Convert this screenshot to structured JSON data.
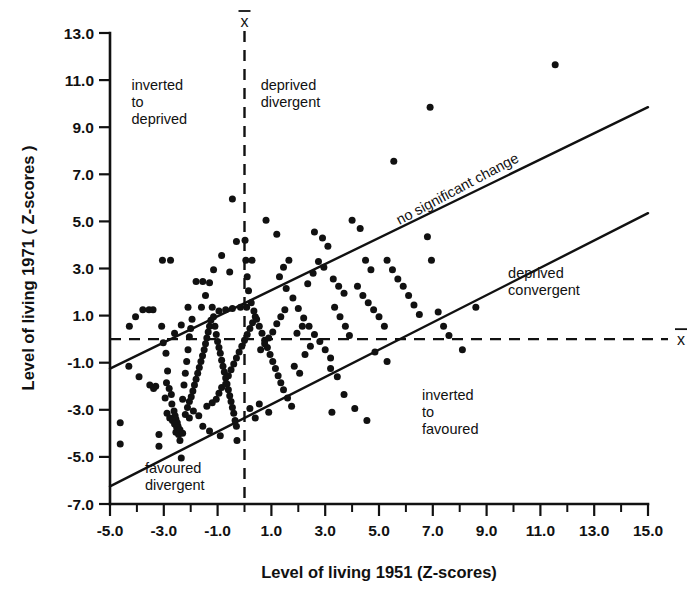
{
  "chart_data": {
    "type": "scatter",
    "title": "",
    "xlabel": "Level of living 1951 (Z-scores)",
    "ylabel": "Level of living 1971 ( Z-scores )",
    "xlim": [
      -5.0,
      15.0
    ],
    "ylim": [
      -7.0,
      13.0
    ],
    "grid": false,
    "legend": "none",
    "xticks": [
      -5.0,
      -3.0,
      -1.0,
      1.0,
      3.0,
      5.0,
      7.0,
      9.0,
      11.0,
      13.0,
      15.0
    ],
    "xticklabels": [
      "-5.0",
      "-3.0",
      "-1.0",
      "1.0",
      "3.0",
      "5.0",
      "7.0",
      "9.0",
      "11.0",
      "13.0",
      "15.0"
    ],
    "xminorticks": [
      -4.0,
      -2.0,
      0.0,
      2.0,
      4.0,
      6.0,
      8.0,
      10.0,
      12.0,
      14.0
    ],
    "yticks": [
      -7.0,
      -5.0,
      -3.0,
      -1.0,
      1.0,
      3.0,
      5.0,
      7.0,
      9.0,
      11.0,
      13.0
    ],
    "yticklabels": [
      "-7.0",
      "-5.0",
      "-3.0",
      "-1.0",
      "1.0",
      "3.0",
      "5.0",
      "7.0",
      "9.0",
      "11.0",
      "13.0"
    ],
    "reference_lines": [
      {
        "name": "mean-x-vertical",
        "orientation": "vertical",
        "value": 0.0,
        "style": "dashed",
        "label": "x̄"
      },
      {
        "name": "mean-y-horizontal",
        "orientation": "horizontal",
        "value": 0.0,
        "style": "dashed",
        "label": "x̄"
      }
    ],
    "band_lines": [
      {
        "name": "upper-band",
        "style": "solid",
        "x0": -5.0,
        "y0": -1.25,
        "x1": 15.0,
        "y1": 9.85
      },
      {
        "name": "lower-band",
        "style": "solid",
        "x0": -5.0,
        "y0": -6.25,
        "x1": 15.0,
        "y1": 5.35
      }
    ],
    "annotations": [
      {
        "name": "inverted-to-deprived",
        "text": "inverted\nto\ndeprived",
        "x": -4.2,
        "y": 10.6
      },
      {
        "name": "deprived-divergent",
        "text": "deprived\ndivergent",
        "x": 0.6,
        "y": 10.6
      },
      {
        "name": "no-significant-change",
        "text": "no significant change",
        "x": 8.0,
        "y": 6.2,
        "rotation": -28
      },
      {
        "name": "deprived-convergent",
        "text": "deprived\nconvergent",
        "x": 9.8,
        "y": 2.6
      },
      {
        "name": "inverted-to-favoured",
        "text": "inverted\nto\nfavoured",
        "x": 6.6,
        "y": -2.6
      },
      {
        "name": "favoured-divergent",
        "text": "favoured\ndivergent",
        "x": -3.7,
        "y": -5.7
      }
    ],
    "n_points": 232,
    "points": [
      [
        -4.62,
        -3.55
      ],
      [
        -4.62,
        -4.45
      ],
      [
        -4.3,
        -1.15
      ],
      [
        -4.28,
        0.55
      ],
      [
        -4.05,
        0.95
      ],
      [
        -3.92,
        -1.6
      ],
      [
        -3.78,
        1.25
      ],
      [
        -3.55,
        1.25
      ],
      [
        -3.4,
        1.25
      ],
      [
        -3.52,
        -1.95
      ],
      [
        -3.3,
        -2.0
      ],
      [
        -3.38,
        -2.1
      ],
      [
        -3.18,
        -4.05
      ],
      [
        -3.18,
        -4.55
      ],
      [
        -3.05,
        3.35
      ],
      [
        -2.75,
        3.35
      ],
      [
        -3.08,
        0.55
      ],
      [
        -3.02,
        -0.15
      ],
      [
        -2.92,
        -0.6
      ],
      [
        -2.86,
        -1.35
      ],
      [
        -2.9,
        -1.85
      ],
      [
        -2.8,
        -2.1
      ],
      [
        -2.72,
        -2.35
      ],
      [
        -2.7,
        -2.75
      ],
      [
        -2.62,
        -3.05
      ],
      [
        -2.58,
        -3.25
      ],
      [
        -2.55,
        -3.4
      ],
      [
        -2.5,
        -3.55
      ],
      [
        -2.47,
        -3.7
      ],
      [
        -2.55,
        -3.95
      ],
      [
        -2.45,
        -4.05
      ],
      [
        -2.4,
        -4.3
      ],
      [
        -2.35,
        -5.05
      ],
      [
        -2.3,
        -2.55
      ],
      [
        -2.25,
        -1.95
      ],
      [
        -2.2,
        -1.45
      ],
      [
        -2.15,
        -0.95
      ],
      [
        -2.1,
        -0.45
      ],
      [
        -2.05,
        0.1
      ],
      [
        -2.0,
        0.45
      ],
      [
        -1.95,
        0.85
      ],
      [
        -2.1,
        1.35
      ],
      [
        -2.35,
        0.6
      ],
      [
        -2.6,
        0.25
      ],
      [
        -2.95,
        -2.5
      ],
      [
        -2.88,
        -3.15
      ],
      [
        -2.78,
        -3.35
      ],
      [
        -2.68,
        -3.45
      ],
      [
        -2.6,
        -3.6
      ],
      [
        -2.52,
        -3.75
      ],
      [
        -2.4,
        -3.85
      ],
      [
        -2.3,
        -4.0
      ],
      [
        -2.2,
        -3.2
      ],
      [
        -2.12,
        -2.9
      ],
      [
        -2.05,
        -2.65
      ],
      [
        -1.98,
        -2.45
      ],
      [
        -1.92,
        -2.2
      ],
      [
        -1.86,
        -1.95
      ],
      [
        -1.8,
        -1.7
      ],
      [
        -1.74,
        -1.45
      ],
      [
        -1.68,
        -1.2
      ],
      [
        -1.62,
        -0.95
      ],
      [
        -1.56,
        -0.7
      ],
      [
        -1.5,
        -0.45
      ],
      [
        -1.45,
        -0.2
      ],
      [
        -1.4,
        0.05
      ],
      [
        -1.35,
        0.3
      ],
      [
        -1.3,
        0.55
      ],
      [
        -1.25,
        0.8
      ],
      [
        -1.6,
        1.35
      ],
      [
        -1.8,
        2.45
      ],
      [
        -1.55,
        2.45
      ],
      [
        -1.3,
        2.4
      ],
      [
        -1.45,
        1.85
      ],
      [
        -1.2,
        1.35
      ],
      [
        -1.15,
        0.95
      ],
      [
        -1.1,
        0.55
      ],
      [
        -1.05,
        0.2
      ],
      [
        -1.0,
        -0.1
      ],
      [
        -0.95,
        -0.35
      ],
      [
        -0.9,
        -0.6
      ],
      [
        -0.85,
        -0.9
      ],
      [
        -0.8,
        -1.15
      ],
      [
        -0.75,
        -1.4
      ],
      [
        -0.7,
        -1.65
      ],
      [
        -0.65,
        -1.9
      ],
      [
        -0.6,
        -2.15
      ],
      [
        -0.55,
        -2.4
      ],
      [
        -0.5,
        -2.65
      ],
      [
        -0.45,
        -2.9
      ],
      [
        -0.4,
        -3.15
      ],
      [
        -0.35,
        -3.45
      ],
      [
        -0.3,
        -3.7
      ],
      [
        -0.28,
        -4.3
      ],
      [
        -0.9,
        -4.1
      ],
      [
        -1.3,
        -3.9
      ],
      [
        -1.55,
        -3.7
      ],
      [
        -1.7,
        -3.25
      ],
      [
        -1.9,
        -3.05
      ],
      [
        -2.05,
        -3.35
      ],
      [
        -1.4,
        -2.85
      ],
      [
        -1.2,
        -2.7
      ],
      [
        -1.05,
        -2.55
      ],
      [
        -0.95,
        -2.3
      ],
      [
        -0.85,
        -2.05
      ],
      [
        -0.7,
        -1.9
      ],
      [
        -0.6,
        -1.55
      ],
      [
        -0.5,
        -1.3
      ],
      [
        -0.4,
        -1.05
      ],
      [
        -0.3,
        -0.8
      ],
      [
        -0.2,
        -0.55
      ],
      [
        -0.1,
        -0.3
      ],
      [
        0.0,
        -0.05
      ],
      [
        0.1,
        0.2
      ],
      [
        0.2,
        0.45
      ],
      [
        0.3,
        0.7
      ],
      [
        0.4,
        0.95
      ],
      [
        0.08,
        1.35
      ],
      [
        -0.15,
        1.35
      ],
      [
        -0.45,
        1.3
      ],
      [
        -0.7,
        1.25
      ],
      [
        -0.95,
        1.2
      ],
      [
        -1.15,
        2.95
      ],
      [
        -0.85,
        3.55
      ],
      [
        -0.55,
        2.85
      ],
      [
        -0.3,
        4.15
      ],
      [
        -0.45,
        5.95
      ],
      [
        0.02,
        4.2
      ],
      [
        0.05,
        3.35
      ],
      [
        0.28,
        3.35
      ],
      [
        0.1,
        2.65
      ],
      [
        0.15,
        2.05
      ],
      [
        0.25,
        1.55
      ],
      [
        0.35,
        1.2
      ],
      [
        0.45,
        0.85
      ],
      [
        0.55,
        0.55
      ],
      [
        0.65,
        0.25
      ],
      [
        0.75,
        -0.05
      ],
      [
        0.85,
        -0.35
      ],
      [
        0.95,
        -0.65
      ],
      [
        1.05,
        -0.95
      ],
      [
        1.15,
        -1.25
      ],
      [
        1.25,
        -1.55
      ],
      [
        1.35,
        -1.85
      ],
      [
        1.45,
        -2.15
      ],
      [
        1.6,
        -2.5
      ],
      [
        1.75,
        -2.85
      ],
      [
        0.55,
        -2.75
      ],
      [
        0.2,
        -2.95
      ],
      [
        0.4,
        -3.35
      ],
      [
        0.9,
        -3.1
      ],
      [
        0.6,
        -0.45
      ],
      [
        0.75,
        -0.2
      ],
      [
        0.9,
        0.05
      ],
      [
        1.05,
        0.3
      ],
      [
        1.2,
        0.65
      ],
      [
        1.35,
        0.95
      ],
      [
        1.5,
        1.25
      ],
      [
        0.8,
        5.05
      ],
      [
        1.2,
        4.45
      ],
      [
        1.45,
        3.05
      ],
      [
        1.65,
        3.35
      ],
      [
        1.3,
        2.65
      ],
      [
        1.55,
        2.15
      ],
      [
        1.8,
        1.75
      ],
      [
        2.0,
        1.3
      ],
      [
        2.2,
        0.9
      ],
      [
        2.4,
        0.55
      ],
      [
        2.6,
        0.2
      ],
      [
        2.8,
        -0.1
      ],
      [
        3.0,
        -0.45
      ],
      [
        3.2,
        -0.8
      ],
      [
        1.85,
        -1.15
      ],
      [
        2.05,
        -1.45
      ],
      [
        2.25,
        -0.65
      ],
      [
        2.45,
        -0.3
      ],
      [
        1.95,
        0.25
      ],
      [
        2.15,
        0.55
      ],
      [
        2.35,
        2.35
      ],
      [
        2.55,
        2.8
      ],
      [
        2.75,
        3.3
      ],
      [
        2.95,
        3.05
      ],
      [
        2.6,
        4.55
      ],
      [
        2.9,
        4.3
      ],
      [
        3.1,
        3.95
      ],
      [
        3.3,
        2.55
      ],
      [
        3.5,
        2.25
      ],
      [
        3.7,
        1.95
      ],
      [
        3.35,
        1.35
      ],
      [
        3.55,
        0.95
      ],
      [
        3.75,
        0.55
      ],
      [
        3.9,
        0.15
      ],
      [
        3.2,
        -1.25
      ],
      [
        3.45,
        -1.6
      ],
      [
        3.7,
        -2.35
      ],
      [
        3.25,
        -3.1
      ],
      [
        4.1,
        -2.95
      ],
      [
        4.55,
        -3.45
      ],
      [
        4.0,
        5.05
      ],
      [
        4.3,
        4.7
      ],
      [
        4.5,
        3.35
      ],
      [
        4.7,
        2.95
      ],
      [
        4.2,
        2.25
      ],
      [
        4.4,
        1.85
      ],
      [
        4.6,
        1.55
      ],
      [
        4.8,
        1.25
      ],
      [
        5.0,
        0.95
      ],
      [
        5.2,
        0.55
      ],
      [
        4.85,
        -0.55
      ],
      [
        5.3,
        -0.95
      ],
      [
        5.55,
        7.55
      ],
      [
        5.3,
        3.35
      ],
      [
        5.5,
        2.95
      ],
      [
        5.7,
        2.55
      ],
      [
        5.9,
        2.25
      ],
      [
        6.1,
        1.85
      ],
      [
        6.3,
        1.45
      ],
      [
        6.5,
        1.05
      ],
      [
        6.8,
        4.35
      ],
      [
        6.9,
        9.85
      ],
      [
        6.95,
        3.35
      ],
      [
        7.2,
        1.15
      ],
      [
        7.4,
        0.55
      ],
      [
        7.6,
        0.15
      ],
      [
        8.1,
        -0.45
      ],
      [
        8.6,
        1.35
      ],
      [
        11.55,
        11.65
      ]
    ]
  },
  "axis": {
    "x_label": "Level of living 1951 (Z-scores)",
    "y_label": "Level of living 1971 ( Z-scores )",
    "mean_symbol_x": "x",
    "mean_symbol_y": "x"
  },
  "quadrant_labels": {
    "inverted_to_deprived": [
      "inverted",
      "to",
      "deprived"
    ],
    "deprived_divergent": [
      "deprived",
      "divergent"
    ],
    "no_significant_change": "no significant change",
    "deprived_convergent": [
      "deprived",
      "convergent"
    ],
    "inverted_to_favoured": [
      "inverted",
      "to",
      "favoured"
    ],
    "favoured_divergent": [
      "favoured",
      "divergent"
    ]
  },
  "colors": {
    "ink": "#111111",
    "background": "#ffffff"
  }
}
